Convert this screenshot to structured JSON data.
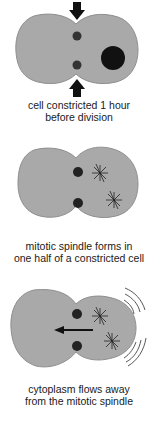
{
  "colors": {
    "cell_fill": "#a9a9a9",
    "cell_stroke": "#8f8f8f",
    "dark": "#111111",
    "background": "#ffffff"
  },
  "panels": [
    {
      "id": "constriction",
      "caption_line1": "cell constricted 1 hour",
      "caption_line2": "before division",
      "elements": [
        "constriction-arrow-top",
        "constriction-arrow-bottom",
        "contractile-dot-top",
        "contractile-dot-bottom",
        "nucleus"
      ]
    },
    {
      "id": "spindle",
      "caption_line1": "mitotic spindle forms in",
      "caption_line2": "one half of a constricted cell",
      "elements": [
        "contractile-dot-top",
        "contractile-dot-bottom",
        "aster-top",
        "aster-bottom"
      ]
    },
    {
      "id": "flow",
      "caption_line1": "cytoplasm flows away",
      "caption_line2": "from the mitotic spindle",
      "elements": [
        "contractile-dot-top",
        "contractile-dot-bottom",
        "aster-top",
        "aster-bottom",
        "flow-arrow-left",
        "motion-lines"
      ]
    }
  ]
}
